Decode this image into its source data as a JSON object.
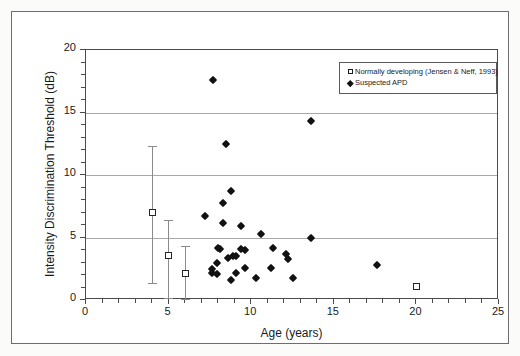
{
  "chart_data": {
    "type": "scatter",
    "title": "",
    "xlabel": "Age (years)",
    "ylabel": "Intensity Discrimination Threshold (dB)",
    "xlim": [
      0,
      25
    ],
    "ylim": [
      0,
      20
    ],
    "xticks": [
      0,
      5,
      10,
      15,
      20,
      25
    ],
    "yticks": [
      0,
      5,
      10,
      15,
      20
    ],
    "xtick_labels": [
      "0",
      "5",
      "10",
      "15",
      "20",
      "25"
    ],
    "ytick_labels": [
      "0",
      "5",
      "10",
      "15",
      "20"
    ],
    "grid": "horizontal",
    "legend_position": "top-right",
    "series": [
      {
        "name": "Normally developing (Jensen & Neff, 1993)",
        "marker": "open-square",
        "points": [
          {
            "x": 4.0,
            "y": 7.0,
            "yerr_low": 1.4,
            "yerr_high": 12.3
          },
          {
            "x": 5.0,
            "y": 3.6,
            "yerr_low": 0.2,
            "yerr_high": 6.4
          },
          {
            "x": 6.0,
            "y": 2.1,
            "yerr_low": 0.1,
            "yerr_high": 4.3
          },
          {
            "x": 20.0,
            "y": 1.1
          }
        ]
      },
      {
        "name": "Suspected APD",
        "marker": "filled-diamond",
        "points": [
          {
            "x": 7.7,
            "y": 17.6
          },
          {
            "x": 13.6,
            "y": 14.3
          },
          {
            "x": 8.5,
            "y": 12.5
          },
          {
            "x": 8.8,
            "y": 8.7
          },
          {
            "x": 8.3,
            "y": 7.8
          },
          {
            "x": 7.2,
            "y": 6.7
          },
          {
            "x": 8.3,
            "y": 6.2
          },
          {
            "x": 9.4,
            "y": 5.9
          },
          {
            "x": 10.6,
            "y": 5.3
          },
          {
            "x": 13.6,
            "y": 5.0
          },
          {
            "x": 8.0,
            "y": 4.2
          },
          {
            "x": 8.1,
            "y": 4.1
          },
          {
            "x": 9.4,
            "y": 4.1
          },
          {
            "x": 9.6,
            "y": 4.0
          },
          {
            "x": 11.3,
            "y": 4.2
          },
          {
            "x": 12.1,
            "y": 3.7
          },
          {
            "x": 12.2,
            "y": 3.3
          },
          {
            "x": 8.6,
            "y": 3.4
          },
          {
            "x": 8.9,
            "y": 3.5
          },
          {
            "x": 9.1,
            "y": 3.5
          },
          {
            "x": 7.9,
            "y": 3.0
          },
          {
            "x": 7.6,
            "y": 2.5
          },
          {
            "x": 9.6,
            "y": 2.6
          },
          {
            "x": 11.2,
            "y": 2.6
          },
          {
            "x": 17.6,
            "y": 2.8
          },
          {
            "x": 7.6,
            "y": 2.2
          },
          {
            "x": 7.9,
            "y": 2.1
          },
          {
            "x": 9.1,
            "y": 2.2
          },
          {
            "x": 8.8,
            "y": 1.6
          },
          {
            "x": 10.3,
            "y": 1.8
          },
          {
            "x": 12.5,
            "y": 1.8
          }
        ]
      }
    ]
  },
  "legend": {
    "entries": [
      {
        "key": "open-square",
        "label": "Normally developing (Jensen & Neff, 1993)"
      },
      {
        "key": "filled-diamond",
        "label": "Suspected APD"
      }
    ]
  },
  "colors": {
    "marker_fill": "#111111",
    "axis": "#4a4a4a",
    "grid": "#a9a9a9",
    "frame": "#6d6d6d",
    "background": "#ffffff"
  }
}
